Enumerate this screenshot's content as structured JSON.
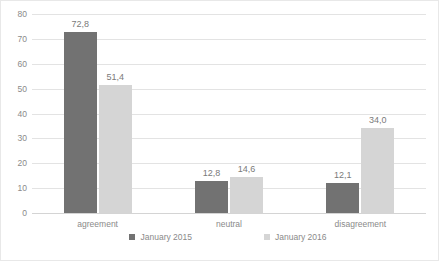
{
  "chart_data": {
    "type": "bar",
    "title": "",
    "subtitle": "",
    "xlabel": "",
    "ylabel": "",
    "categories": [
      "agreement",
      "neutral",
      "disagreement"
    ],
    "series": [
      {
        "name": "January 2015",
        "color": "#727272",
        "values": [
          72.8,
          12.8,
          12.1
        ],
        "labels": [
          "72,8",
          "12,8",
          "12,1"
        ]
      },
      {
        "name": "January 2016",
        "color": "#d5d5d5",
        "values": [
          51.4,
          14.6,
          34.0
        ],
        "labels": [
          "51,4",
          "14,6",
          "34,0"
        ]
      }
    ],
    "ylim": [
      0,
      80
    ],
    "ytick_values": [
      0,
      10,
      20,
      30,
      40,
      50,
      60,
      70,
      80
    ],
    "ytick_labels": [
      "0",
      "10",
      "20",
      "30",
      "40",
      "50",
      "60",
      "70",
      "80"
    ],
    "grid": "horizontal",
    "legend_position": "bottom",
    "decimal_separator": ","
  }
}
